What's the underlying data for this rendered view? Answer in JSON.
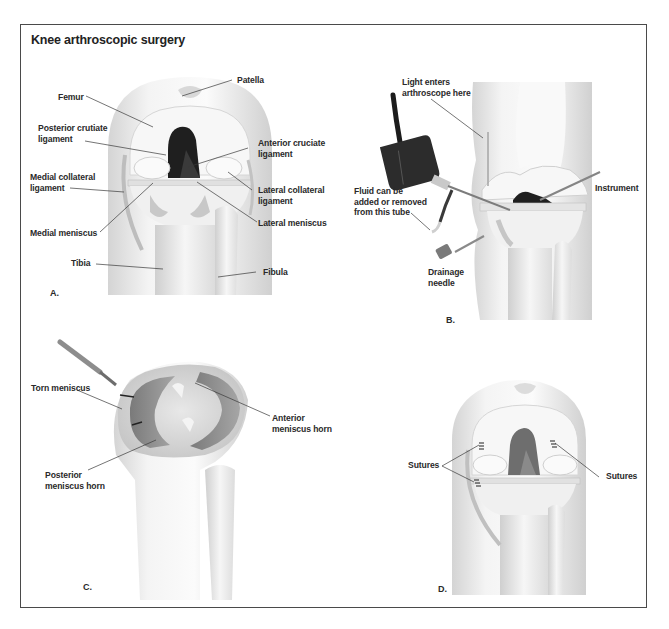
{
  "figure": {
    "title": "Knee arthroscopic surgery",
    "colors": {
      "frame": "#4a4a4a",
      "bone_light": "#f2f2f2",
      "bone_shade": "#c9c9c9",
      "cartilage_dark": "#222222",
      "meniscus_gray": "#8c8c8c",
      "leader_line": "#3a3a3a"
    },
    "panels": [
      {
        "id": "A",
        "letter": "A.",
        "labels": [
          {
            "key": "patella",
            "text": "Patella"
          },
          {
            "key": "femur",
            "text": "Femur"
          },
          {
            "key": "pcl",
            "text": "Posterior crutiate\nligament"
          },
          {
            "key": "acl",
            "text": "Anterior cruciate\nligament"
          },
          {
            "key": "mcl",
            "text": "Medial collateral\nligament"
          },
          {
            "key": "lcl",
            "text": "Lateral collateral\nligament"
          },
          {
            "key": "medial_meniscus",
            "text": "Medial meniscus"
          },
          {
            "key": "lateral_meniscus",
            "text": "Lateral meniscus"
          },
          {
            "key": "tibia",
            "text": "Tibia"
          },
          {
            "key": "fibula",
            "text": "Fibula"
          }
        ]
      },
      {
        "id": "B",
        "letter": "B.",
        "labels": [
          {
            "key": "light",
            "text": "Light enters\narthroscope here"
          },
          {
            "key": "fluid",
            "text": "Fluid can be\nadded or removed\nfrom this tube"
          },
          {
            "key": "instrument",
            "text": "Instrument"
          },
          {
            "key": "drainage",
            "text": "Drainage\nneedle"
          }
        ]
      },
      {
        "id": "C",
        "letter": "C.",
        "labels": [
          {
            "key": "torn",
            "text": "Torn meniscus"
          },
          {
            "key": "anterior_horn",
            "text": "Anterior\nmeniscus horn"
          },
          {
            "key": "posterior_horn",
            "text": "Posterior\nmeniscus horn"
          }
        ]
      },
      {
        "id": "D",
        "letter": "D.",
        "labels": [
          {
            "key": "sutures_left",
            "text": "Sutures"
          },
          {
            "key": "sutures_right",
            "text": "Sutures"
          }
        ]
      }
    ]
  }
}
